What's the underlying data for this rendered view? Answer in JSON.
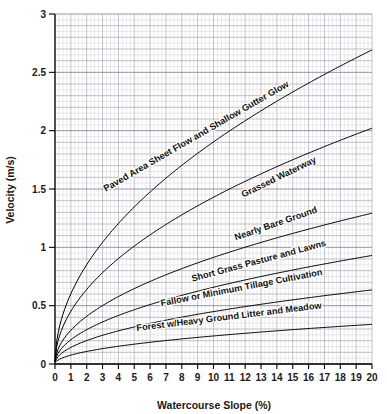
{
  "chart_data": {
    "type": "line",
    "title": "",
    "xlabel": "Watercourse Slope (%)",
    "ylabel": "Velocity (m/s)",
    "xlim": [
      0,
      20
    ],
    "ylim": [
      0,
      3
    ],
    "x_ticks": [
      "0",
      "1",
      "2",
      "3",
      "4",
      "5",
      "6",
      "7",
      "8",
      "9",
      "10",
      "11",
      "12",
      "13",
      "14",
      "15",
      "16",
      "17",
      "18",
      "19",
      "20"
    ],
    "y_ticks": [
      "0",
      "0.5",
      "1",
      "1.5",
      "2",
      "2.5",
      "3"
    ],
    "grid": true,
    "grid_minor": true,
    "legend_position": "inline-curve-labels",
    "x": [
      0,
      0.25,
      0.5,
      1,
      1.5,
      2,
      3,
      4,
      5,
      6,
      7,
      8,
      9,
      10,
      11,
      12,
      13,
      14,
      15,
      16,
      17,
      18,
      19,
      20
    ],
    "series": [
      {
        "name": "Paved Area Sheet Flow and Shallow Gutter Glow",
        "label_x": 9.0,
        "label_y": 1.93,
        "label_angle": -30,
        "coefficient": 0.602,
        "values": [
          0.03,
          0.33,
          0.45,
          0.63,
          0.77,
          0.88,
          1.07,
          1.23,
          1.37,
          1.5,
          1.62,
          1.73,
          1.83,
          1.93,
          2.02,
          2.11,
          2.2,
          2.28,
          2.36,
          2.44,
          2.51,
          2.58,
          2.65,
          2.72
        ]
      },
      {
        "name": "Grassed Waterway",
        "label_x": 14.2,
        "label_y": 1.58,
        "label_angle": -26,
        "coefficient": 0.452,
        "values": [
          0.03,
          0.25,
          0.35,
          0.48,
          0.58,
          0.67,
          0.81,
          0.93,
          1.04,
          1.13,
          1.22,
          1.31,
          1.39,
          1.46,
          1.53,
          1.6,
          1.66,
          1.72,
          1.78,
          1.84,
          1.9,
          1.95,
          2.0,
          2.05
        ]
      },
      {
        "name": "Nearly Bare Ground",
        "label_x": 14.0,
        "label_y": 1.18,
        "label_angle": -19,
        "coefficient": 0.289,
        "values": [
          0.02,
          0.16,
          0.22,
          0.31,
          0.37,
          0.42,
          0.52,
          0.59,
          0.66,
          0.72,
          0.78,
          0.84,
          0.89,
          0.94,
          0.98,
          1.03,
          1.07,
          1.11,
          1.15,
          1.18,
          1.22,
          1.25,
          1.29,
          1.32
        ]
      },
      {
        "name": "Short Grass Pasture and Lawns",
        "label_x": 12.9,
        "label_y": 0.86,
        "label_angle": -15,
        "coefficient": 0.208,
        "values": [
          0.02,
          0.12,
          0.16,
          0.22,
          0.27,
          0.31,
          0.37,
          0.43,
          0.47,
          0.52,
          0.56,
          0.6,
          0.64,
          0.67,
          0.71,
          0.74,
          0.77,
          0.8,
          0.83,
          0.85,
          0.88,
          0.9,
          0.93,
          0.95
        ]
      },
      {
        "name": "Fallow or Minimum Tillage Cultivation",
        "label_x": 11.8,
        "label_y": 0.63,
        "label_angle": -11,
        "coefficient": 0.142,
        "values": [
          0.02,
          0.09,
          0.12,
          0.16,
          0.19,
          0.22,
          0.26,
          0.3,
          0.33,
          0.36,
          0.39,
          0.41,
          0.44,
          0.46,
          0.48,
          0.5,
          0.52,
          0.54,
          0.56,
          0.58,
          0.6,
          0.61,
          0.63,
          0.64
        ]
      },
      {
        "name": "Forest w/Heavy Ground Litter and Meadow",
        "label_x": 11.0,
        "label_y": 0.38,
        "label_angle": -7,
        "coefficient": 0.076,
        "values": [
          0.01,
          0.05,
          0.07,
          0.09,
          0.11,
          0.12,
          0.14,
          0.16,
          0.18,
          0.2,
          0.21,
          0.22,
          0.24,
          0.25,
          0.26,
          0.27,
          0.28,
          0.29,
          0.3,
          0.31,
          0.32,
          0.33,
          0.34,
          0.35
        ]
      }
    ]
  },
  "colors": {
    "curve": "#000000",
    "axis": "#000000",
    "grid_minor": "#c9c9d2",
    "grid_major": "#9a9aa6",
    "background": "#ffffff",
    "text": "#1a1a1a"
  }
}
